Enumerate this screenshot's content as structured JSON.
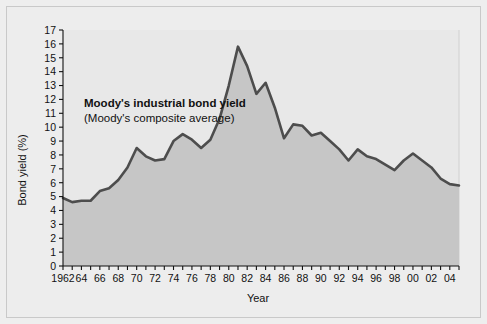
{
  "figure": {
    "background_color": "#ededed",
    "border_color": "#c9c9c9"
  },
  "chart_data": {
    "type": "area",
    "title": "",
    "xlabel": "Year",
    "ylabel": "Bond yield (%)",
    "xlim": [
      1962,
      2005
    ],
    "ylim": [
      0,
      17
    ],
    "grid": false,
    "legend_position": "inside-upper-left",
    "line_color": "#4d4d4d",
    "fill_color": "#c6c6c6",
    "annotations": [
      {
        "text": "Moody's industrial bond yield",
        "style": "bold"
      },
      {
        "text": "(Moody's composite average)",
        "style": "regular"
      }
    ],
    "series": [
      {
        "name": "Moody's industrial bond yield",
        "x": [
          1962,
          1963,
          1964,
          1965,
          1966,
          1967,
          1968,
          1969,
          1970,
          1971,
          1972,
          1973,
          1974,
          1975,
          1976,
          1977,
          1978,
          1979,
          1980,
          1981,
          1982,
          1983,
          1984,
          1985,
          1986,
          1987,
          1988,
          1989,
          1990,
          1991,
          1992,
          1993,
          1994,
          1995,
          1996,
          1997,
          1998,
          1999,
          2000,
          2001,
          2002,
          2003,
          2004,
          2005
        ],
        "values": [
          4.9,
          4.6,
          4.7,
          4.7,
          5.4,
          5.6,
          6.2,
          7.1,
          8.5,
          7.9,
          7.6,
          7.7,
          9.0,
          9.5,
          9.1,
          8.5,
          9.1,
          10.6,
          13.0,
          15.8,
          14.4,
          12.4,
          13.2,
          11.4,
          9.2,
          10.2,
          10.1,
          9.4,
          9.6,
          9.0,
          8.4,
          7.6,
          8.4,
          7.9,
          7.7,
          7.3,
          6.9,
          7.6,
          8.1,
          7.6,
          7.1,
          6.3,
          5.9,
          5.8
        ]
      }
    ],
    "y_ticks": [
      0,
      1,
      2,
      3,
      4,
      5,
      6,
      7,
      8,
      9,
      10,
      11,
      12,
      13,
      14,
      15,
      16,
      17
    ],
    "x_tick_labels": [
      "1962",
      "64",
      "66",
      "68",
      "70",
      "72",
      "74",
      "76",
      "78",
      "80",
      "82",
      "84",
      "86",
      "88",
      "90",
      "92",
      "94",
      "96",
      "98",
      "00",
      "02",
      "04"
    ],
    "x_tick_values": [
      1962,
      1964,
      1966,
      1968,
      1970,
      1972,
      1974,
      1976,
      1978,
      1980,
      1982,
      1984,
      1986,
      1988,
      1990,
      1992,
      1994,
      1996,
      1998,
      2000,
      2002,
      2004
    ]
  }
}
